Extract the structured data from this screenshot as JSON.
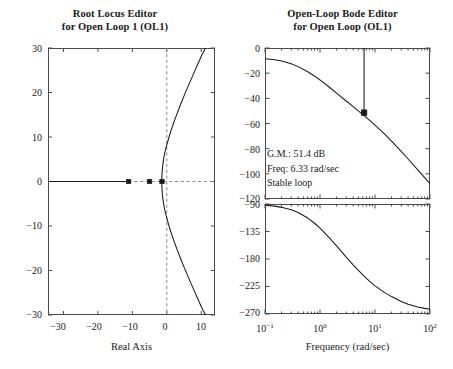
{
  "figure": {
    "width": 453,
    "height": 369,
    "background": "#ffffff",
    "line_color": "#1a1a1a",
    "axis_color": "#4a4a4a",
    "grid_color": "#8c8c8c"
  },
  "root_locus": {
    "title_line1": "Root Locus Editor",
    "title_line2": "for Open Loop 1 (OL1)",
    "xlabel": "Real Axis",
    "ylabel": "",
    "xticks": [
      -30,
      -20,
      -10,
      0,
      10
    ],
    "xtick_labels": [
      "−30",
      "−20",
      "−10",
      "0",
      "10"
    ],
    "yticks": [
      -30,
      -20,
      -10,
      0,
      10,
      20,
      30
    ],
    "ytick_labels": [
      "−30",
      "−20",
      "−10",
      "0",
      "10",
      "20",
      "30"
    ],
    "xlim": [
      -34.5,
      14
    ],
    "ylim": [
      -30,
      30
    ],
    "real_axis_line": true,
    "imag_axis_dashed": true,
    "markers": [
      {
        "name": "closed-loop-pole-1",
        "real": -11.1,
        "imag": 0
      },
      {
        "name": "closed-loop-pole-2",
        "real": -5.0,
        "imag": 0
      },
      {
        "name": "closed-loop-pole-3",
        "real": -1.4,
        "imag": 0
      }
    ],
    "branch_upper": [
      [
        -1.45,
        0.0
      ],
      [
        -1.42,
        1.2
      ],
      [
        -1.33,
        2.4
      ],
      [
        -1.18,
        3.6
      ],
      [
        -0.97,
        4.8
      ],
      [
        -0.7,
        6.0
      ],
      [
        -0.35,
        7.2
      ],
      [
        0.1,
        8.5
      ],
      [
        0.65,
        10.0
      ],
      [
        1.3,
        11.6
      ],
      [
        2.1,
        13.4
      ],
      [
        3.0,
        15.3
      ],
      [
        4.0,
        17.3
      ],
      [
        5.1,
        19.4
      ],
      [
        6.3,
        21.6
      ],
      [
        7.6,
        23.9
      ],
      [
        8.95,
        26.3
      ],
      [
        10.35,
        28.7
      ],
      [
        11.25,
        30.0
      ]
    ],
    "branch_lower": [
      [
        -1.45,
        0.0
      ],
      [
        -1.42,
        -1.2
      ],
      [
        -1.33,
        -2.4
      ],
      [
        -1.18,
        -3.6
      ],
      [
        -0.97,
        -4.8
      ],
      [
        -0.7,
        -6.0
      ],
      [
        -0.35,
        -7.2
      ],
      [
        0.1,
        -8.5
      ],
      [
        0.65,
        -10.0
      ],
      [
        1.3,
        -11.6
      ],
      [
        2.1,
        -13.4
      ],
      [
        3.0,
        -15.3
      ],
      [
        4.0,
        -17.3
      ],
      [
        5.1,
        -19.4
      ],
      [
        6.3,
        -21.6
      ],
      [
        7.6,
        -23.9
      ],
      [
        8.95,
        -26.3
      ],
      [
        10.35,
        -28.7
      ],
      [
        11.25,
        -30.0
      ]
    ]
  },
  "bode": {
    "title_line1": "Open-Loop Bode Editor",
    "title_line2": "for Open Loop (OL1)",
    "xlabel": "Frequency (rad/sec)",
    "xtick_labels": [
      "10⁻¹",
      "10⁰",
      "10¹",
      "10²"
    ],
    "xtick_mantissa": [
      "10",
      "10",
      "10",
      "10"
    ],
    "xtick_exponent": [
      "−1",
      "0",
      "1",
      "2"
    ],
    "xlim_decades": [
      -1,
      2
    ],
    "magnitude": {
      "yticks": [
        0,
        -20,
        -40,
        -60,
        -80,
        -100,
        -120
      ],
      "ytick_labels": [
        "0",
        "−20",
        "−40",
        "−60",
        "−80",
        "−100",
        "−120"
      ],
      "ylim": [
        -120,
        0
      ],
      "unit": "dB",
      "curve": [
        [
          0.1,
          -8.6
        ],
        [
          0.15,
          -9.4
        ],
        [
          0.2,
          -10.4
        ],
        [
          0.3,
          -12.6
        ],
        [
          0.4,
          -14.8
        ],
        [
          0.6,
          -18.9
        ],
        [
          0.8,
          -22.4
        ],
        [
          1.0,
          -25.4
        ],
        [
          1.5,
          -31.4
        ],
        [
          2.0,
          -35.8
        ],
        [
          3.0,
          -42.1
        ],
        [
          4.0,
          -46.6
        ],
        [
          6.0,
          -53.0
        ],
        [
          6.33,
          -53.8
        ],
        [
          8.0,
          -57.5
        ],
        [
          10.0,
          -61.3
        ],
        [
          15.0,
          -68.5
        ],
        [
          20.0,
          -74.0
        ],
        [
          30.0,
          -82.2
        ],
        [
          40.0,
          -88.2
        ],
        [
          60.0,
          -96.8
        ],
        [
          80.0,
          -103.0
        ],
        [
          100.0,
          -107.9
        ]
      ],
      "gain_margin_marker": {
        "freq": 6.33,
        "gain_db": -51.4
      },
      "gain_margin_line": {
        "freq": 6.33,
        "from_db": 0,
        "to_db": -51.4
      }
    },
    "phase": {
      "yticks": [
        -90,
        -135,
        -180,
        -225,
        -270
      ],
      "ytick_labels": [
        "−90",
        "−135",
        "−180",
        "−225",
        "−270"
      ],
      "ylim": [
        -270,
        -90
      ],
      "unit": "deg",
      "curve": [
        [
          0.1,
          -92.0
        ],
        [
          0.15,
          -93.5
        ],
        [
          0.2,
          -95.5
        ],
        [
          0.3,
          -99.5
        ],
        [
          0.4,
          -104.0
        ],
        [
          0.6,
          -113.0
        ],
        [
          0.8,
          -121.5
        ],
        [
          1.0,
          -129.5
        ],
        [
          1.5,
          -146.0
        ],
        [
          2.0,
          -158.5
        ],
        [
          3.0,
          -177.0
        ],
        [
          4.0,
          -189.5
        ],
        [
          6.0,
          -206.0
        ],
        [
          8.0,
          -216.5
        ],
        [
          10.0,
          -224.0
        ],
        [
          15.0,
          -235.0
        ],
        [
          20.0,
          -241.5
        ],
        [
          30.0,
          -249.5
        ],
        [
          40.0,
          -254.0
        ],
        [
          60.0,
          -258.5
        ],
        [
          80.0,
          -260.8
        ],
        [
          100.0,
          -262.2
        ]
      ]
    },
    "annotation": {
      "gain_margin": "G.M.: 51.4 dB",
      "frequency": "Freq: 6.33 rad/sec",
      "stability": "Stable loop"
    }
  }
}
